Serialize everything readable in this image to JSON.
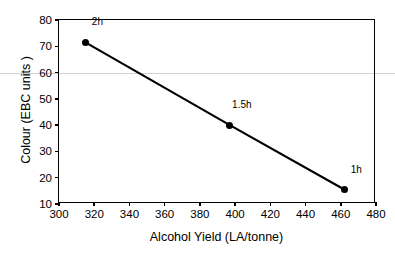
{
  "chart_data": {
    "type": "scatter",
    "title": "",
    "xlabel": "Alcohol Yield (LA/tonne)",
    "ylabel": "Colour (EBC units )",
    "xlim": [
      300,
      480
    ],
    "ylim": [
      10,
      80
    ],
    "xticks": [
      300,
      320,
      340,
      360,
      380,
      400,
      420,
      440,
      460,
      480
    ],
    "yticks": [
      10,
      20,
      30,
      40,
      50,
      60,
      70,
      80
    ],
    "grid": false,
    "legend": "none",
    "series": [
      {
        "name": "Colour vs Alcohol Yield",
        "x": [
          315,
          397,
          462
        ],
        "y": [
          71.5,
          40,
          15.5
        ],
        "point_labels": [
          "2h",
          "1.5h",
          "1h"
        ],
        "marker": "filled-circle",
        "line": "solid",
        "color": "#000000"
      }
    ]
  },
  "axes": {
    "x_tick_labels": [
      "300",
      "320",
      "340",
      "360",
      "380",
      "400",
      "420",
      "440",
      "460",
      "480"
    ],
    "y_tick_labels": [
      "10",
      "20",
      "30",
      "40",
      "50",
      "60",
      "70",
      "80"
    ],
    "x_title": "Alcohol Yield (LA/tonne)",
    "y_title": "Colour (EBC units )"
  },
  "annotations": [
    {
      "label": "2h"
    },
    {
      "label": "1.5h"
    },
    {
      "label": "1h"
    }
  ]
}
